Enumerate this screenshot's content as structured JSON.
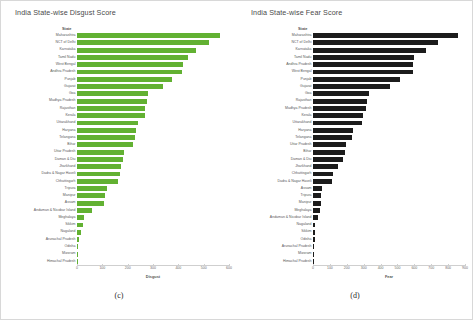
{
  "figure": {
    "background": "#ffffff",
    "border_color": "#d8d8d8"
  },
  "panels": [
    {
      "id": "c",
      "caption": "(c)",
      "title": "India State-wise Disgust Score",
      "ylabel": "State",
      "xlabel": "Disgust",
      "bar_color": "#62b132"
    },
    {
      "id": "d",
      "caption": "(d)",
      "title": "India State-wise Fear Score",
      "ylabel": "State",
      "xlabel": "Fear",
      "bar_color": "#1c1c1c"
    }
  ],
  "chart_data": [
    {
      "type": "bar",
      "orientation": "horizontal",
      "title": "India State-wise Disgust Score",
      "xlabel": "Disgust",
      "ylabel": "State",
      "xlim": [
        0,
        600
      ],
      "xticks": [
        0,
        100,
        200,
        300,
        400,
        500,
        600
      ],
      "grid": false,
      "legend": "none",
      "color": "#62b132",
      "categories": [
        "Maharashtra",
        "NCT of Delhi",
        "Karnataka",
        "Tamil Nadu",
        "West Bengal",
        "Andhra Pradesh",
        "Punjab",
        "Gujarat",
        "Goa",
        "Madhya Pradesh",
        "Rajasthan",
        "Kerala",
        "Uttarakhand",
        "Haryana",
        "Telangana",
        "Bihar",
        "Uttar Pradesh",
        "Daman & Diu",
        "Jharkhand",
        "Dadra & Nagar Haveli",
        "Chhattisgarh",
        "Tripura",
        "Manipur",
        "Assam",
        "Andaman & Nicobar Island",
        "Meghalaya",
        "Sikkim",
        "Nagaland",
        "Arunachal Pradesh",
        "Odisha",
        "Mizoram",
        "Himachal Pradesh"
      ],
      "values": [
        565,
        520,
        470,
        440,
        420,
        415,
        375,
        340,
        280,
        275,
        270,
        268,
        240,
        232,
        228,
        222,
        185,
        180,
        175,
        170,
        160,
        120,
        112,
        108,
        60,
        28,
        22,
        14,
        6,
        5,
        4,
        3
      ]
    },
    {
      "type": "bar",
      "orientation": "horizontal",
      "title": "India State-wise Fear Score",
      "xlabel": "Fear",
      "ylabel": "State",
      "xlim": [
        0,
        900
      ],
      "xticks": [
        0,
        100,
        200,
        300,
        400,
        500,
        600,
        700,
        800,
        900
      ],
      "grid": false,
      "legend": "none",
      "color": "#1c1c1c",
      "categories": [
        "Maharashtra",
        "NCT of Delhi",
        "Karnataka",
        "Tamil Nadu",
        "Andhra Pradesh",
        "West Bengal",
        "Punjab",
        "Gujarat",
        "Goa",
        "Rajasthan",
        "Madhya Pradesh",
        "Kerala",
        "Uttarakhand",
        "Haryana",
        "Telangana",
        "Uttar Pradesh",
        "Bihar",
        "Daman & Diu",
        "Jharkhand",
        "Chhattisgarh",
        "Dadra & Nagar Haveli",
        "Assam",
        "Tripura",
        "Manipur",
        "Meghalaya",
        "Andaman & Nicobar Island",
        "Nagaland",
        "Sikkim",
        "Odisha",
        "Arunachal Pradesh",
        "Mizoram",
        "Himachal Pradesh"
      ],
      "values": [
        860,
        740,
        670,
        600,
        595,
        590,
        515,
        455,
        330,
        318,
        312,
        295,
        290,
        235,
        228,
        195,
        190,
        180,
        150,
        118,
        112,
        52,
        48,
        45,
        42,
        30,
        14,
        12,
        10,
        8,
        5,
        4
      ]
    }
  ]
}
